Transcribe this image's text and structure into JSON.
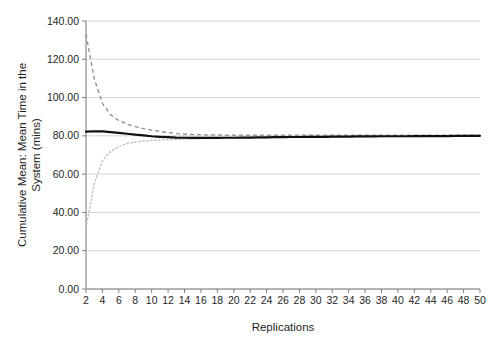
{
  "chart_data": {
    "type": "line",
    "title": "",
    "xlabel": "Replications",
    "ylabel": "Cumulative Mean: Mean Time in the System (mins)",
    "ylabel_line1": "Cumulative Mean: Mean Time in the",
    "ylabel_line2": "System (mins)",
    "xlim": [
      2,
      50
    ],
    "ylim": [
      0,
      140
    ],
    "grid": true,
    "legend": "none",
    "ytick_labels": [
      "140.00",
      "120.00",
      "100.00",
      "80.00",
      "60.00",
      "40.00",
      "20.00",
      "0.00"
    ],
    "ytick_values": [
      140,
      120,
      100,
      80,
      60,
      40,
      20,
      0
    ],
    "xtick_labels": [
      "2",
      "4",
      "6",
      "8",
      "10",
      "12",
      "14",
      "16",
      "18",
      "20",
      "22",
      "24",
      "26",
      "28",
      "30",
      "32",
      "34",
      "36",
      "38",
      "40",
      "42",
      "44",
      "46",
      "48",
      "50"
    ],
    "x": [
      2,
      3,
      4,
      5,
      6,
      7,
      8,
      9,
      10,
      11,
      12,
      13,
      14,
      15,
      16,
      17,
      18,
      19,
      20,
      21,
      22,
      23,
      24,
      25,
      26,
      27,
      28,
      29,
      30,
      31,
      32,
      33,
      34,
      35,
      36,
      37,
      38,
      39,
      40,
      41,
      42,
      43,
      44,
      45,
      46,
      47,
      48,
      49,
      50
    ],
    "series": [
      {
        "name": "Upper 95% confidence limit",
        "style": "dashed",
        "color": "#8c8c8c",
        "values": [
          133.0,
          110.0,
          97.0,
          91.0,
          88.0,
          86.2,
          84.8,
          83.8,
          83.0,
          82.3,
          81.7,
          81.2,
          80.9,
          80.7,
          80.6,
          80.5,
          80.5,
          80.4,
          80.4,
          80.4,
          80.4,
          80.4,
          80.4,
          80.4,
          80.4,
          80.4,
          80.4,
          80.4,
          80.4,
          80.4,
          80.4,
          80.4,
          80.4,
          80.4,
          80.4,
          80.4,
          80.4,
          80.4,
          80.4,
          80.4,
          80.4,
          80.4,
          80.4,
          80.4,
          80.4,
          80.4,
          80.4,
          80.4,
          80.4
        ]
      },
      {
        "name": "Cumulative mean",
        "style": "solid",
        "color": "#111111",
        "values": [
          82.2,
          82.4,
          82.3,
          82.0,
          81.6,
          81.1,
          80.6,
          80.2,
          79.8,
          79.5,
          79.3,
          79.1,
          79.0,
          78.9,
          78.9,
          78.9,
          78.9,
          79.0,
          79.0,
          79.1,
          79.1,
          79.2,
          79.2,
          79.3,
          79.3,
          79.4,
          79.4,
          79.5,
          79.5,
          79.5,
          79.6,
          79.6,
          79.6,
          79.7,
          79.7,
          79.7,
          79.8,
          79.8,
          79.8,
          79.8,
          79.9,
          79.9,
          79.9,
          79.9,
          79.9,
          80.0,
          80.0,
          80.0,
          80.0
        ]
      },
      {
        "name": "Lower 95% confidence limit",
        "style": "dotted",
        "color": "#bdbdbd",
        "values": [
          32.0,
          55.0,
          67.0,
          72.0,
          74.5,
          76.0,
          76.8,
          77.3,
          77.6,
          77.9,
          78.1,
          78.2,
          78.3,
          78.4,
          78.5,
          78.6,
          78.7,
          78.8,
          78.8,
          78.9,
          78.9,
          79.0,
          79.0,
          79.1,
          79.1,
          79.2,
          79.2,
          79.3,
          79.3,
          79.4,
          79.4,
          79.4,
          79.5,
          79.5,
          79.5,
          79.6,
          79.6,
          79.6,
          79.7,
          79.7,
          79.7,
          79.7,
          79.8,
          79.8,
          79.8,
          79.8,
          79.9,
          79.9,
          79.9
        ]
      }
    ]
  }
}
